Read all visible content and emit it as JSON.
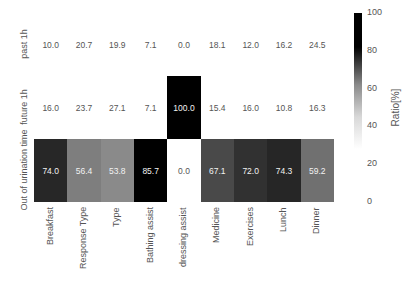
{
  "chart_data": {
    "type": "heatmap",
    "title": "",
    "xlabel": "",
    "ylabel": "",
    "rows": [
      "past 1h",
      "future 1h",
      "Out of urination time"
    ],
    "columns": [
      "Breakfast",
      "Response Type",
      "Type",
      "Bathing assist",
      "dressing assist",
      "Medicine",
      "Exercises",
      "Lunch",
      "Dinner"
    ],
    "values": [
      [
        10.0,
        20.7,
        19.9,
        7.1,
        0.0,
        18.1,
        12.0,
        16.2,
        24.5
      ],
      [
        16.0,
        23.7,
        27.1,
        7.1,
        100.0,
        15.4,
        16.0,
        10.8,
        16.3
      ],
      [
        74.0,
        56.4,
        53.8,
        85.7,
        0.0,
        67.1,
        72.0,
        74.3,
        59.2
      ]
    ],
    "colormap": "Greys (white below ~30, black above ~80)",
    "colorbar": {
      "label": "Ratio[%]",
      "ticks": [
        0,
        20,
        40,
        60,
        80,
        100
      ],
      "range": [
        0,
        100
      ]
    },
    "annotations": "values shown in each cell with 1 decimal"
  }
}
